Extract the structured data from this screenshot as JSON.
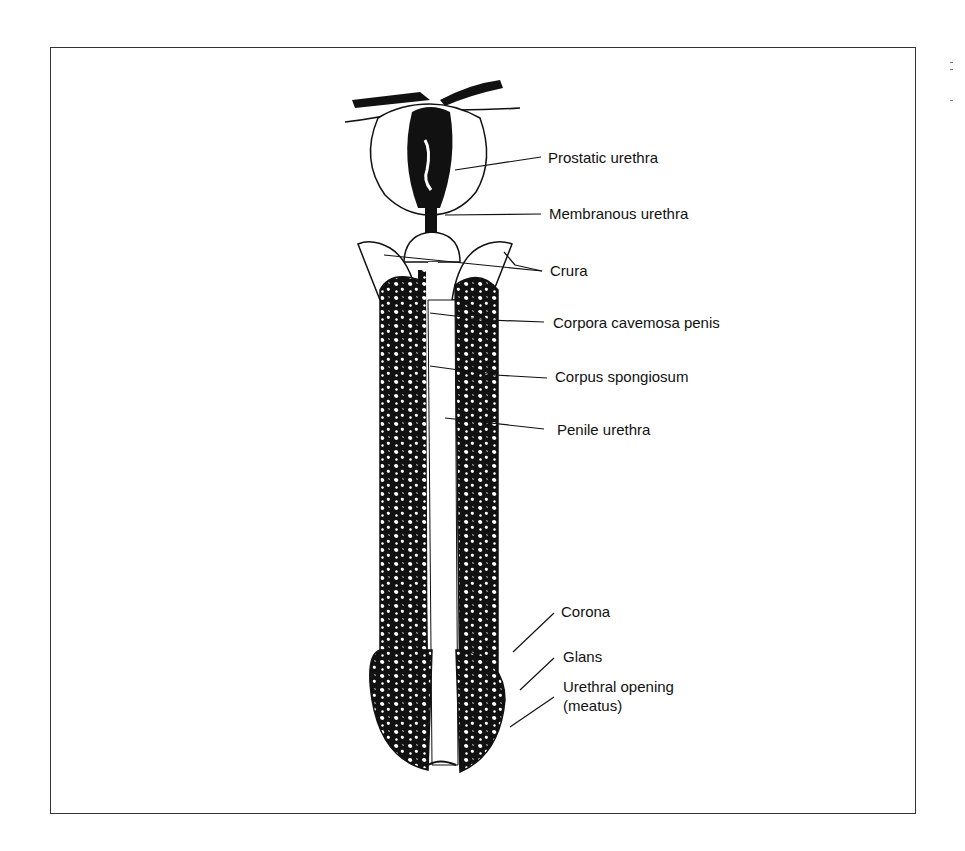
{
  "figure": {
    "type": "anatomical line drawing",
    "labels": [
      {
        "id": "prostatic-urethra",
        "text": "Prostatic urethra"
      },
      {
        "id": "membranous-urethra",
        "text": "Membranous urethra"
      },
      {
        "id": "crura",
        "text": "Crura"
      },
      {
        "id": "corpora-cavernosa",
        "text": "Corpora cavemosa penis"
      },
      {
        "id": "corpus-spongiosum",
        "text": "Corpus spongiosum"
      },
      {
        "id": "penile-urethra",
        "text": "Penile urethra"
      },
      {
        "id": "corona",
        "text": "Corona"
      },
      {
        "id": "glans",
        "text": "Glans"
      },
      {
        "id": "urethral-opening",
        "text": "Urethral opening"
      },
      {
        "id": "meatus",
        "text": "(meatus)"
      }
    ]
  },
  "colors": {
    "ink": "#111111",
    "background": "#ffffff",
    "frame": "#333333"
  }
}
